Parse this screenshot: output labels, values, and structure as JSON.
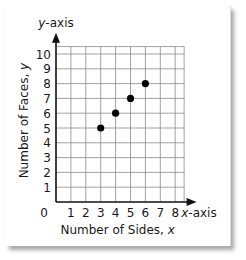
{
  "chart_data": {
    "type": "scatter",
    "title": "",
    "xlabel": "Number of Sides, x",
    "ylabel": "Number of Faces, y",
    "x_axis_name": "x-axis",
    "y_axis_name": "y-axis",
    "x_ticks": [
      0,
      1,
      2,
      3,
      4,
      5,
      6,
      7,
      8
    ],
    "y_ticks": [
      1,
      2,
      3,
      4,
      5,
      6,
      7,
      8,
      9,
      10
    ],
    "xlim": [
      0,
      8
    ],
    "ylim": [
      0,
      10
    ],
    "grid": true,
    "points": [
      {
        "x": 3,
        "y": 5
      },
      {
        "x": 4,
        "y": 6
      },
      {
        "x": 5,
        "y": 7
      },
      {
        "x": 6,
        "y": 8
      }
    ]
  },
  "labels": {
    "y_axis": "y-axis",
    "x_axis": "x-axis",
    "origin": "0",
    "xlabel_text": "Number of Sides, ",
    "xlabel_var": "x",
    "ylabel_text": "Number of Faces, ",
    "ylabel_var": "y"
  }
}
